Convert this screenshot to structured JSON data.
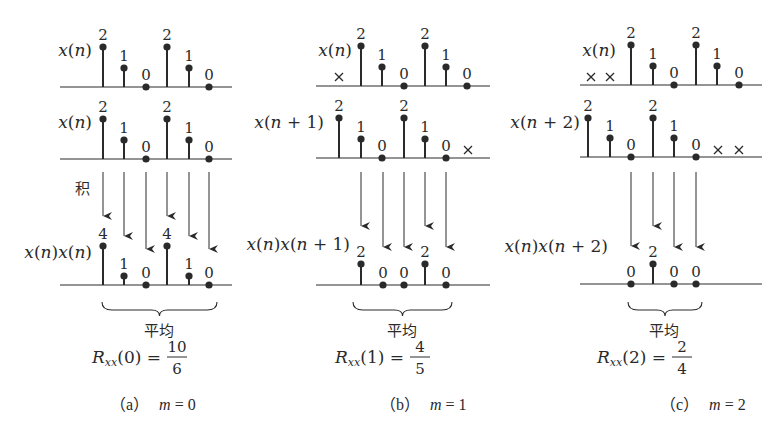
{
  "figure": {
    "colors": {
      "ink": "#2a2a2a",
      "background": "#ffffff"
    },
    "panels": [
      {
        "id": "a",
        "caption_label": "（a）",
        "caption_m": "m = 0",
        "rows": [
          {
            "label": "x(n)",
            "label_x": 92,
            "label_y": 56,
            "baseline_y": 87,
            "axis_x": [
              60,
              232
            ],
            "points": [
              {
                "x": 103,
                "v": "2",
                "y": 47
              },
              {
                "x": 124,
                "v": "1",
                "y": 68
              },
              {
                "x": 146,
                "v": "0",
                "y": 87
              },
              {
                "x": 167,
                "v": "2",
                "y": 47
              },
              {
                "x": 189,
                "v": "1",
                "y": 68
              },
              {
                "x": 209,
                "v": "0",
                "y": 87
              }
            ],
            "crosses": []
          },
          {
            "label": "x(n)",
            "label_x": 92,
            "label_y": 128,
            "baseline_y": 159,
            "axis_x": [
              60,
              232
            ],
            "points": [
              {
                "x": 103,
                "v": "2",
                "y": 119
              },
              {
                "x": 124,
                "v": "1",
                "y": 140
              },
              {
                "x": 146,
                "v": "0",
                "y": 159
              },
              {
                "x": 167,
                "v": "2",
                "y": 119
              },
              {
                "x": 189,
                "v": "1",
                "y": 140
              },
              {
                "x": 209,
                "v": "0",
                "y": 159
              }
            ],
            "crosses": []
          },
          {
            "label": "x(n)x(n)",
            "label_x": 92,
            "label_y": 258,
            "baseline_y": 285,
            "axis_x": [
              60,
              232
            ],
            "points": [
              {
                "x": 103,
                "v": "4",
                "y": 246
              },
              {
                "x": 124,
                "v": "1",
                "y": 276
              },
              {
                "x": 146,
                "v": "0",
                "y": 285
              },
              {
                "x": 167,
                "v": "4",
                "y": 246
              },
              {
                "x": 189,
                "v": "1",
                "y": 276
              },
              {
                "x": 209,
                "v": "0",
                "y": 285
              }
            ],
            "crosses": []
          }
        ],
        "arrows": [
          {
            "x": 103,
            "y1": 172,
            "y2": 216
          },
          {
            "x": 124,
            "y1": 172,
            "y2": 236
          },
          {
            "x": 146,
            "y1": 172,
            "y2": 249
          },
          {
            "x": 167,
            "y1": 172,
            "y2": 216
          },
          {
            "x": 189,
            "y1": 172,
            "y2": 236
          },
          {
            "x": 209,
            "y1": 172,
            "y2": 249
          }
        ],
        "product_note": "积",
        "product_note_x": 82,
        "product_note_y": 194,
        "brace": {
          "x1": 102,
          "x2": 217,
          "y": 302
        },
        "average_label": "平均",
        "average_x": 159,
        "result": {
          "name": "R",
          "sub": "xx",
          "arg": "(0)",
          "num": "10",
          "den": "6",
          "cx": 159
        }
      },
      {
        "id": "b",
        "caption_label": "（b）",
        "caption_m": "m = 1",
        "rows": [
          {
            "label": "x(n)",
            "label_x": 352,
            "label_y": 56,
            "baseline_y": 86,
            "axis_x": [
              316,
              490
            ],
            "points": [
              {
                "x": 361,
                "v": "2",
                "y": 46
              },
              {
                "x": 382,
                "v": "1",
                "y": 67
              },
              {
                "x": 404,
                "v": "0",
                "y": 86
              },
              {
                "x": 425,
                "v": "2",
                "y": 46
              },
              {
                "x": 446,
                "v": "1",
                "y": 67
              },
              {
                "x": 467,
                "v": "0",
                "y": 86
              }
            ],
            "crosses": [
              {
                "x": 339,
                "y": 77
              }
            ]
          },
          {
            "label": "x(n + 1)",
            "label_x": 324,
            "label_y": 128,
            "baseline_y": 158,
            "axis_x": [
              316,
              490
            ],
            "points": [
              {
                "x": 339,
                "v": "2",
                "y": 118
              },
              {
                "x": 361,
                "v": "1",
                "y": 139
              },
              {
                "x": 382,
                "v": "0",
                "y": 158
              },
              {
                "x": 404,
                "v": "2",
                "y": 118
              },
              {
                "x": 425,
                "v": "1",
                "y": 139
              },
              {
                "x": 446,
                "v": "0",
                "y": 158
              }
            ],
            "crosses": [
              {
                "x": 468,
                "y": 150
              }
            ]
          },
          {
            "label": "x(n)x(n + 1)",
            "label_x": 350,
            "label_y": 250,
            "baseline_y": 285,
            "axis_x": [
              316,
              490
            ],
            "points": [
              {
                "x": 361,
                "v": "2",
                "y": 264
              },
              {
                "x": 383,
                "v": "0",
                "y": 285
              },
              {
                "x": 404,
                "v": "0",
                "y": 285
              },
              {
                "x": 425,
                "v": "2",
                "y": 264
              },
              {
                "x": 446,
                "v": "0",
                "y": 285
              }
            ],
            "crosses": []
          }
        ],
        "arrows": [
          {
            "x": 361,
            "y1": 172,
            "y2": 226
          },
          {
            "x": 383,
            "y1": 172,
            "y2": 247
          },
          {
            "x": 404,
            "y1": 172,
            "y2": 247
          },
          {
            "x": 425,
            "y1": 172,
            "y2": 226
          },
          {
            "x": 446,
            "y1": 172,
            "y2": 247
          }
        ],
        "product_note": "",
        "product_note_x": 0,
        "product_note_y": 0,
        "brace": {
          "x1": 353,
          "x2": 452,
          "y": 302
        },
        "average_label": "平均",
        "average_x": 402,
        "result": {
          "name": "R",
          "sub": "xx",
          "arg": "(1)",
          "num": "4",
          "den": "5",
          "cx": 402
        }
      },
      {
        "id": "c",
        "caption_label": "（c）",
        "caption_m": "m = 2",
        "rows": [
          {
            "label": "x(n)",
            "label_x": 616,
            "label_y": 56,
            "baseline_y": 85,
            "axis_x": [
              580,
              762
            ],
            "points": [
              {
                "x": 631,
                "v": "2",
                "y": 45
              },
              {
                "x": 653,
                "v": "1",
                "y": 66
              },
              {
                "x": 674,
                "v": "0",
                "y": 85
              },
              {
                "x": 696,
                "v": "2",
                "y": 45
              },
              {
                "x": 717,
                "v": "1",
                "y": 66
              },
              {
                "x": 739,
                "v": "0",
                "y": 85
              }
            ],
            "crosses": [
              {
                "x": 591,
                "y": 77
              },
              {
                "x": 610,
                "y": 77
              }
            ]
          },
          {
            "label": "x(n + 2)",
            "label_x": 580,
            "label_y": 128,
            "baseline_y": 157,
            "axis_x": [
              580,
              762
            ],
            "points": [
              {
                "x": 588,
                "v": "2",
                "y": 118
              },
              {
                "x": 610,
                "v": "1",
                "y": 138
              },
              {
                "x": 631,
                "v": "0",
                "y": 157
              },
              {
                "x": 653,
                "v": "2",
                "y": 118
              },
              {
                "x": 674,
                "v": "1",
                "y": 138
              },
              {
                "x": 696,
                "v": "0",
                "y": 157
              }
            ],
            "crosses": [
              {
                "x": 718,
                "y": 150
              },
              {
                "x": 739,
                "y": 150
              }
            ]
          },
          {
            "label": "x(n)x(n + 2)",
            "label_x": 608,
            "label_y": 252,
            "baseline_y": 284,
            "axis_x": [
              580,
              762
            ],
            "points": [
              {
                "x": 631,
                "v": "0",
                "y": 284
              },
              {
                "x": 653,
                "v": "2",
                "y": 264
              },
              {
                "x": 674,
                "v": "0",
                "y": 284
              },
              {
                "x": 696,
                "v": "0",
                "y": 284
              }
            ],
            "crosses": []
          }
        ],
        "arrows": [
          {
            "x": 631,
            "y1": 172,
            "y2": 246
          },
          {
            "x": 653,
            "y1": 172,
            "y2": 226
          },
          {
            "x": 674,
            "y1": 172,
            "y2": 247
          },
          {
            "x": 696,
            "y1": 172,
            "y2": 247
          }
        ],
        "product_note": "",
        "product_note_x": 0,
        "product_note_y": 0,
        "brace": {
          "x1": 628,
          "x2": 702,
          "y": 302
        },
        "average_label": "平均",
        "average_x": 664,
        "result": {
          "name": "R",
          "sub": "xx",
          "arg": "(2)",
          "num": "2",
          "den": "4",
          "cx": 664
        }
      }
    ],
    "caption_y": 410,
    "caption_x": [
      110,
      380,
      660
    ]
  }
}
